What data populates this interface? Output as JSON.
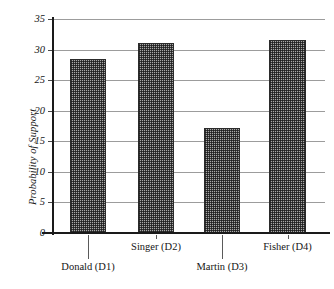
{
  "chart_data": {
    "type": "bar",
    "title": "",
    "subtitle": "",
    "xlabel": "",
    "ylabel": "Probability of Support",
    "categories": [
      "Donald (D1)",
      "Singer (D2)",
      "Martin (D3)",
      "Fisher (D4)"
    ],
    "values": [
      28.5,
      31.0,
      17.2,
      31.6
    ],
    "ylim": [
      0,
      35
    ],
    "yticks": [
      0,
      5,
      10,
      15,
      20,
      25,
      30,
      35
    ],
    "ytick_labels": [
      "0",
      "5",
      "10",
      "15",
      "20",
      "25",
      "30",
      "35"
    ],
    "grid": true,
    "legend": null,
    "series": [
      {
        "name": "Probability of Support",
        "values": [
          28.5,
          31.0,
          17.2,
          31.6
        ]
      }
    ],
    "bar_fill": "cross-hatch-gray",
    "bar_edge_color": "#2b2b2b",
    "gridline_color": "#9c9c9c",
    "axis_color": "#1a1a1a",
    "label_rows": [
      0,
      1,
      0,
      1
    ]
  },
  "axis": {
    "y_title": "Probability of Support"
  }
}
